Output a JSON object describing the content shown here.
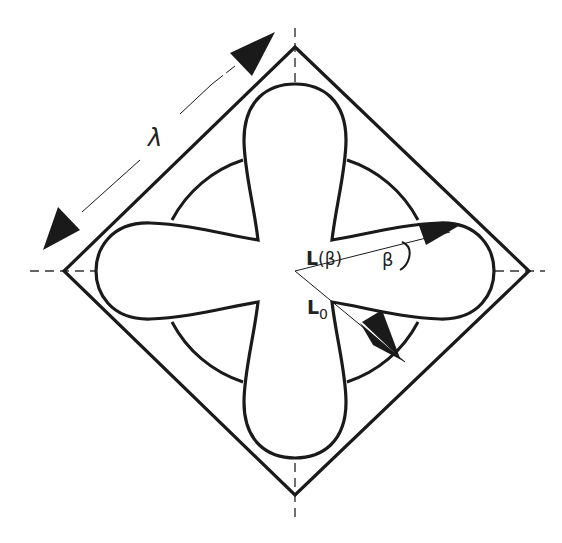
{
  "diagram": {
    "colors": {
      "stroke": "#1a1a1a",
      "dash": "#333333",
      "background": "#ffffff"
    },
    "labels": {
      "lambda": "λ",
      "l_beta_main": "L",
      "l_beta_arg": "(β)",
      "beta": "β",
      "l_zero_main": "L",
      "l_zero_sub": "0"
    },
    "elements": {
      "diamond": "Square rotated 45°, side length λ",
      "circle": "Circle centered at origin",
      "petals": "Four petal lobes along horizontal and vertical axes",
      "axes": "Dashed horizontal and vertical center lines",
      "dimension_arrow": "Double-headed arrow parallel to upper-left diamond edge indicating λ",
      "vector_l_beta": "Vector from center at angle β above the horizontal, length L(β)",
      "vector_l0": "Vector from center along the 45° diagonal, length L0"
    }
  }
}
